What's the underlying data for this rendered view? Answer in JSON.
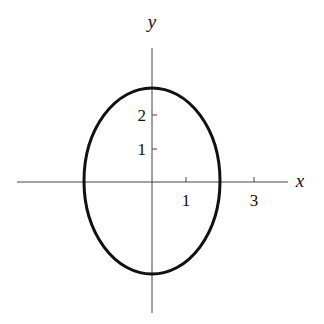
{
  "figure": {
    "type": "ellipse-graph",
    "equation_hint": "ellipse centered at origin, x-intercepts ±2, y-intercepts ≈ ±2.8",
    "axes": {
      "x_label": "x",
      "y_label": "y",
      "x_ticks": [
        {
          "value": 1,
          "label": "1"
        },
        {
          "value": 3,
          "label": "3"
        }
      ],
      "y_ticks": [
        {
          "value": 1,
          "label": "1"
        },
        {
          "value": 2,
          "label": "2"
        }
      ]
    },
    "curve": {
      "center": [
        0,
        0
      ],
      "semi_axis_x": 2,
      "semi_axis_y": 2.8,
      "stroke_color": "#111111"
    }
  }
}
